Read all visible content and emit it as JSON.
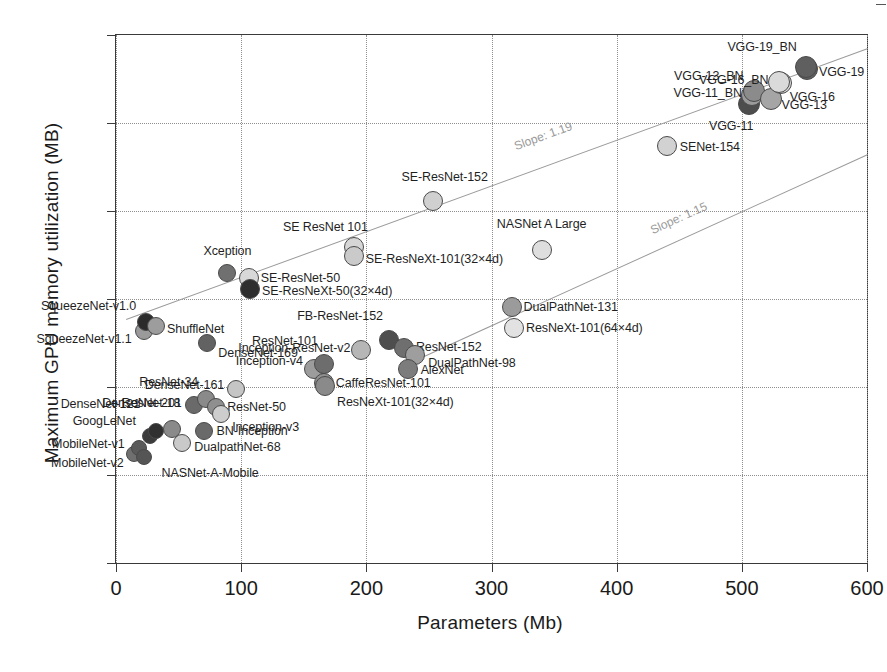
{
  "chart_data": {
    "type": "scatter",
    "title": "",
    "xlabel": "Parameters (Mb)",
    "ylabel": "Maximum GPU memory utilization (MB)",
    "xlim": [
      0,
      600
    ],
    "ylim": [
      400,
      1600
    ],
    "xticks": [
      0,
      100,
      200,
      300,
      400,
      500,
      600
    ],
    "yticks": [
      400,
      600,
      800,
      1000,
      1200,
      1400,
      1600
    ],
    "grid": true,
    "legend": "none",
    "annotations": [
      {
        "text": "Slope: 1.19",
        "x": 320,
        "y": 1332
      },
      {
        "text": "Slope: 1.15",
        "x": 430,
        "y": 1140
      }
    ],
    "trend_lines": [
      {
        "name": "upper",
        "slope_label": "Slope: 1.19",
        "x0": 8,
        "y0": 955,
        "x1": 600,
        "y1": 1570
      },
      {
        "name": "lower",
        "slope_label": "Slope: 1.15",
        "x0": 237,
        "y0": 860,
        "x1": 600,
        "y1": 1330
      }
    ],
    "points": [
      {
        "label": "MobileNet-v2",
        "x": 14,
        "y": 648,
        "r": 8,
        "fill": "#6f6f6f",
        "label_pos": "rl",
        "label_dx": -10,
        "label_dy": 9
      },
      {
        "label": "MobileNet-v1",
        "x": 18,
        "y": 662,
        "r": 8,
        "fill": "#5a5a5a",
        "label_pos": "rl",
        "label_dx": -14,
        "label_dy": -4
      },
      {
        "label": "GoogLeNet",
        "x": 27,
        "y": 688,
        "r": 8,
        "fill": "#3c3c3c",
        "label_pos": "rl",
        "label_dx": -14,
        "label_dy": -15
      },
      {
        "label": "DenseNet-121",
        "x": 32,
        "y": 700,
        "r": 8,
        "fill": "#303030",
        "label_pos": "rl",
        "label_dx": -16,
        "label_dy": -27
      },
      {
        "label": "NASNet-A-Mobile",
        "x": 22,
        "y": 640,
        "r": 8,
        "fill": "#555555",
        "label_pos": "lr",
        "label_dx": 18,
        "label_dy": 16
      },
      {
        "label": "ResNet-18",
        "x": 45,
        "y": 705,
        "r": 9,
        "fill": "#8a8a8a",
        "label_pos": "rl",
        "label_dx": 8,
        "label_dy": -26
      },
      {
        "label": "DualpathNet-68",
        "x": 53,
        "y": 672,
        "r": 9,
        "fill": "#c9c9c9",
        "label_pos": "lr",
        "label_dx": 12,
        "label_dy": 4
      },
      {
        "label": "BN-Inception",
        "x": 70,
        "y": 700,
        "r": 9,
        "fill": "#6a6a6a",
        "label_pos": "lr",
        "label_dx": 13,
        "label_dy": 0
      },
      {
        "label": "DenseNet-201",
        "x": 62,
        "y": 760,
        "r": 9,
        "fill": "#6a6a6a",
        "label_pos": "rl",
        "label_dx": -12,
        "label_dy": -2
      },
      {
        "label": "ResNet-34",
        "x": 72,
        "y": 772,
        "r": 9,
        "fill": "#8a8a8a",
        "label_pos": "rl",
        "label_dx": -8,
        "label_dy": -17
      },
      {
        "label": "ResNet-50",
        "x": 80,
        "y": 755,
        "r": 9,
        "fill": "#8f8f8f",
        "label_pos": "lr",
        "label_dx": 11,
        "label_dy": 0
      },
      {
        "label": "Inception-v3",
        "x": 84,
        "y": 738,
        "r": 9,
        "fill": "#cdcdcd",
        "label_pos": "lr",
        "label_dx": 11,
        "label_dy": 13
      },
      {
        "label": "DenseNet-161",
        "x": 96,
        "y": 796,
        "r": 9,
        "fill": "#c5c5c5",
        "label_pos": "rl",
        "label_dx": -12,
        "label_dy": -4
      },
      {
        "label": "SqueezeNet-v1.1",
        "x": 22,
        "y": 928,
        "r": 9,
        "fill": "#9a9a9a",
        "label_pos": "rl",
        "label_dx": -12,
        "label_dy": 8
      },
      {
        "label": "SqueezeNet-v1.0",
        "x": 24,
        "y": 948,
        "r": 9,
        "fill": "#2b2b2b",
        "label_pos": "rl",
        "label_dx": -10,
        "label_dy": -16
      },
      {
        "label": "ShuffleNet",
        "x": 32,
        "y": 938,
        "r": 9,
        "fill": "#9d9d9d",
        "label_pos": "lr",
        "label_dx": 11,
        "label_dy": 3
      },
      {
        "label": "DenseNet-169",
        "x": 73,
        "y": 900,
        "r": 9,
        "fill": "#626262",
        "label_pos": "lr",
        "label_dx": 11,
        "label_dy": 10
      },
      {
        "label": "Xception",
        "x": 89,
        "y": 1060,
        "r": 9,
        "fill": "#707070",
        "label_pos": "ctr",
        "label_dx": 0,
        "label_dy": -22
      },
      {
        "label": "SE-ResNet-50",
        "x": 106,
        "y": 1047,
        "r": 10,
        "fill": "#d8d8d8",
        "label_pos": "lr",
        "label_dx": 12,
        "label_dy": 0
      },
      {
        "label": "SE-ResNeXt-50(32×4d)",
        "x": 107,
        "y": 1022,
        "r": 10,
        "fill": "#2e2e2e",
        "label_pos": "lr",
        "label_dx": 12,
        "label_dy": 2
      },
      {
        "label": "Inception-v4",
        "x": 158,
        "y": 842,
        "r": 10,
        "fill": "#9c9c9c",
        "label_pos": "rl",
        "label_dx": -11,
        "label_dy": -8
      },
      {
        "label": "ResNet-101",
        "x": 166,
        "y": 852,
        "r": 10,
        "fill": "#6d6d6d",
        "label_pos": "rl",
        "label_dx": -6,
        "label_dy": -23
      },
      {
        "label": "CaffeResNet-101",
        "x": 166,
        "y": 810,
        "r": 10,
        "fill": "#909090",
        "label_pos": "lr",
        "label_dx": 12,
        "label_dy": 0
      },
      {
        "label": "ResNeXt-101(32×4d)",
        "x": 167,
        "y": 802,
        "r": 10,
        "fill": "#8a8a8a",
        "label_pos": "lr",
        "label_dx": 12,
        "label_dy": 16
      },
      {
        "label": "Inception-ResNet-v2",
        "x": 196,
        "y": 884,
        "r": 10,
        "fill": "#b6b6b6",
        "label_pos": "rl",
        "label_dx": -11,
        "label_dy": -2
      },
      {
        "label": "FB-ResNet-152",
        "x": 218,
        "y": 907,
        "r": 10,
        "fill": "#4e4e4e",
        "label_pos": "rl",
        "label_dx": -6,
        "label_dy": -24
      },
      {
        "label": "ResNet-152",
        "x": 230,
        "y": 888,
        "r": 10,
        "fill": "#6f6f6f",
        "label_pos": "lr",
        "label_dx": 12,
        "label_dy": -1
      },
      {
        "label": "DualPathNet-98",
        "x": 239,
        "y": 872,
        "r": 10,
        "fill": "#9e9e9e",
        "label_pos": "lr",
        "label_dx": 13,
        "label_dy": 8
      },
      {
        "label": "AlexNet",
        "x": 233,
        "y": 841,
        "r": 10,
        "fill": "#7c7c7c",
        "label_pos": "lr",
        "label_dx": 13,
        "label_dy": 1
      },
      {
        "label": "SE ResNet 101",
        "x": 190,
        "y": 1118,
        "r": 10,
        "fill": "#d6d6d6",
        "label_pos": "rl",
        "label_dx": 14,
        "label_dy": -20
      },
      {
        "label": "SE-ResNeXt-101(32×4d)",
        "x": 190,
        "y": 1098,
        "r": 10,
        "fill": "#cacaca",
        "label_pos": "lr",
        "label_dx": 12,
        "label_dy": 3
      },
      {
        "label": "SE-ResNet-152",
        "x": 253,
        "y": 1222,
        "r": 10,
        "fill": "#d0d0d0",
        "label_pos": "ctr",
        "label_dx": 12,
        "label_dy": -24
      },
      {
        "label": "NASNet A Large",
        "x": 340,
        "y": 1112,
        "r": 10,
        "fill": "#dedede",
        "label_pos": "ctr",
        "label_dx": 0,
        "label_dy": -26
      },
      {
        "label": "DualPathNet-131",
        "x": 316,
        "y": 982,
        "r": 10,
        "fill": "#9b9b9b",
        "label_pos": "lr",
        "label_dx": 12,
        "label_dy": 0
      },
      {
        "label": "ResNeXt-101(64×4d)",
        "x": 318,
        "y": 935,
        "r": 10,
        "fill": "#e2e2e2",
        "label_pos": "lr",
        "label_dx": 12,
        "label_dy": 0
      },
      {
        "label": "SENet-154",
        "x": 440,
        "y": 1348,
        "r": 10,
        "fill": "#d2d2d2",
        "label_pos": "lr",
        "label_dx": 13,
        "label_dy": 1
      },
      {
        "label": "VGG-11",
        "x": 506,
        "y": 1443,
        "r": 11,
        "fill": "#4d4d4d",
        "label_pos": "rl",
        "label_dx": 4,
        "label_dy": 22
      },
      {
        "label": "VGG-11_BN",
        "x": 508,
        "y": 1463,
        "r": 11,
        "fill": "#9b9b9b",
        "label_pos": "rl",
        "label_dx": -10,
        "label_dy": -2
      },
      {
        "label": "VGG-13_BN",
        "x": 510,
        "y": 1473,
        "r": 11,
        "fill": "#8b8b8b",
        "label_pos": "rl",
        "label_dx": -11,
        "label_dy": -15
      },
      {
        "label": "VGG-13",
        "x": 523,
        "y": 1455,
        "r": 11,
        "fill": "#a5a5a5",
        "label_pos": "lr",
        "label_dx": 11,
        "label_dy": 6
      },
      {
        "label": "VGG-16",
        "x": 531,
        "y": 1490,
        "r": 11,
        "fill": "#dadada",
        "label_pos": "lr",
        "label_dx": 9,
        "label_dy": 14
      },
      {
        "label": "VGG-16_BN",
        "x": 530,
        "y": 1494,
        "r": 11,
        "fill": "#dadada",
        "label_pos": "rl",
        "label_dx": -11,
        "label_dy": -2
      },
      {
        "label": "VGG-19",
        "x": 552,
        "y": 1523,
        "r": 11,
        "fill": "#5f5f5f",
        "label_pos": "lr",
        "label_dx": 12,
        "label_dy": 3
      },
      {
        "label": "VGG-19_BN",
        "x": 551,
        "y": 1527,
        "r": 11,
        "fill": "#5f5f5f",
        "label_pos": "rl",
        "label_dx": -9,
        "label_dy": -20
      }
    ]
  },
  "figure": {
    "corner_mark": "frame-tick"
  }
}
